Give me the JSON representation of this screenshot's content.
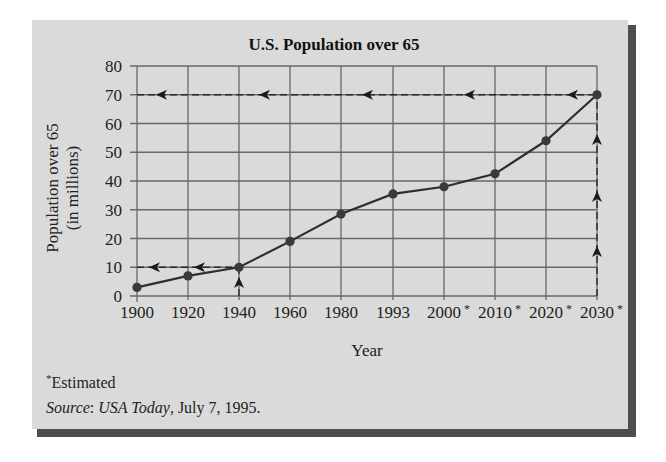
{
  "chart_data": {
    "type": "line",
    "title": "U.S. Population over 65",
    "xlabel": "Year",
    "ylabel": [
      "Population over 65",
      "(in millions)"
    ],
    "categories": [
      "1900",
      "1920",
      "1940",
      "1960",
      "1980",
      "1993",
      "2000*",
      "2010*",
      "2020*",
      "2030*"
    ],
    "estimated": [
      false,
      false,
      false,
      false,
      false,
      false,
      true,
      true,
      true,
      true
    ],
    "series": [
      {
        "name": "Population over 65 (millions)",
        "values": [
          3,
          7,
          10,
          19,
          28.5,
          35.5,
          38,
          42.5,
          54,
          70
        ]
      }
    ],
    "yticks": [
      0,
      10,
      20,
      30,
      40,
      50,
      60,
      70,
      80
    ],
    "ylim": [
      0,
      80
    ],
    "grid": true,
    "legend": null,
    "annotations": [
      {
        "type": "dashed-guide",
        "from": "1940 on x-axis",
        "to": "10 on y-axis",
        "description": "Up arrow at 1940, left arrows along y=10"
      },
      {
        "type": "dashed-guide",
        "from": "2030 on x-axis",
        "to": "70 on y-axis",
        "description": "Up arrows along 2030, left arrows along y=70"
      }
    ],
    "footnote": "*Estimated",
    "source": {
      "label": "Source",
      "publication": "USA Today",
      "date": ", July 7, 1995."
    }
  },
  "footnote_mark": "*",
  "footnote_text": "Estimated",
  "source_label": "Source",
  "source_sep": ": ",
  "source_pub": "USA Today",
  "source_date": ", July 7, 1995."
}
